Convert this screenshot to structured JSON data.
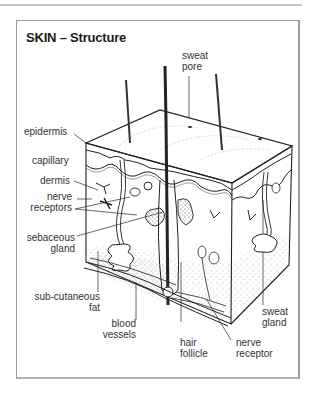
{
  "title": "SKIN – Structure",
  "labels": {
    "sweat_pore": [
      "sweat",
      "pore"
    ],
    "epidermis": "epidermis",
    "capillary": "capillary",
    "dermis": "dermis",
    "nerve_receptors": [
      "nerve",
      "receptors"
    ],
    "sebaceous_gland": [
      "sebaceous",
      "gland"
    ],
    "subcutaneous_fat": [
      "sub-cutaneous",
      "fat"
    ],
    "blood_vessels": [
      "blood",
      "vessels"
    ],
    "hair_follicle": [
      "hair",
      "follicle"
    ],
    "nerve_receptor": [
      "nerve",
      "receptor"
    ],
    "sweat_gland": [
      "sweat",
      "gland"
    ]
  },
  "colors": {
    "ink": "#222222",
    "frame": "#9a9a9a",
    "rule": "#c8c8c8"
  }
}
